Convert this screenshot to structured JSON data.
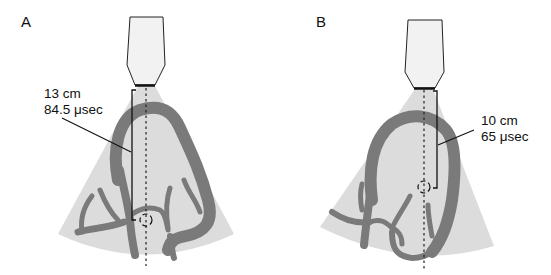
{
  "figure": {
    "panels": [
      {
        "id": "A",
        "label": "A",
        "depth": "13 cm",
        "time": "84.5 μsec"
      },
      {
        "id": "B",
        "label": "B",
        "depth": "10 cm",
        "time": "65 μsec"
      }
    ],
    "colors": {
      "sector_fill": "#dcdcdc",
      "vessel_fill": "#7a7a7a",
      "probe_fill": "#f2f2f2",
      "line": "#111111"
    }
  }
}
